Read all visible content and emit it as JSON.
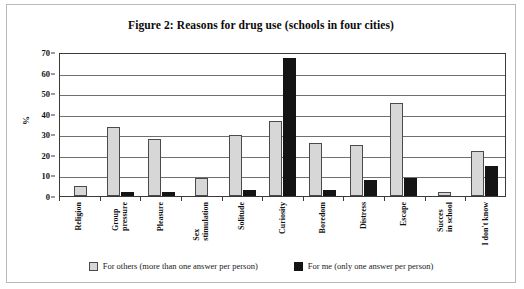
{
  "chart_data": {
    "type": "bar",
    "title": "Figure 2: Reasons for drug use (schools in four cities)",
    "xlabel": "",
    "ylabel": "%",
    "ylim": [
      0,
      70
    ],
    "yticks": [
      0,
      10,
      20,
      30,
      40,
      50,
      60,
      70
    ],
    "grid": true,
    "legend_position": "bottom",
    "categories": [
      "Religion",
      "Group pressure",
      "Pleasure",
      "Sex stimulation",
      "Solitude",
      "Curiosity",
      "Boredom",
      "Distress",
      "Escape",
      "Succes in school",
      "I don't know"
    ],
    "category_lines": [
      [
        "Religion",
        ""
      ],
      [
        "Group",
        "pressure"
      ],
      [
        "Pleasure",
        ""
      ],
      [
        "Sex",
        "stimulation"
      ],
      [
        "Solitude",
        ""
      ],
      [
        "Curiosity",
        ""
      ],
      [
        "Boredom",
        ""
      ],
      [
        "Distress",
        ""
      ],
      [
        "Escape",
        ""
      ],
      [
        "Succes",
        "in school"
      ],
      [
        "I don't know",
        ""
      ]
    ],
    "series": [
      {
        "name": "For others (more than one answer per person)",
        "color": "#d7d7d7",
        "values": [
          5,
          34,
          28,
          9,
          30,
          37,
          26,
          25,
          46,
          2,
          22
        ]
      },
      {
        "name": "For me (only one answer per person)",
        "color": "#141414",
        "values": [
          0,
          2,
          2,
          0,
          3,
          68,
          3,
          8,
          9,
          0,
          15
        ]
      }
    ]
  },
  "legend": {
    "entries": [
      "For others (more than one answer per person)",
      "For me (only one answer per person)"
    ]
  }
}
